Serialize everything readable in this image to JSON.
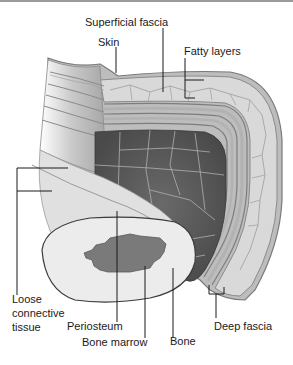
{
  "figure": {
    "labels": {
      "superficial_fascia": "Superficial fascia",
      "skin": "Skin",
      "fatty_layers": "Fatty layers",
      "loose_connective_line1": "Loose",
      "loose_connective_line2": "connective",
      "loose_connective_line3": "tissue",
      "periosteum": "Periosteum",
      "bone_marrow": "Bone marrow",
      "bone": "Bone",
      "deep_fascia": "Deep fascia"
    },
    "colors": {
      "skin": "#8a8a8a",
      "fat": "#d6d6d6",
      "fat_cell_lines": "#9c9c9c",
      "muscle": "#5a5a5a",
      "muscle_lines": "#b0b0b0",
      "fascia_bands": "#c8c8c8",
      "bone": "#ececec",
      "marrow": "#7a7a7a",
      "text": "#1a1a1a"
    }
  }
}
